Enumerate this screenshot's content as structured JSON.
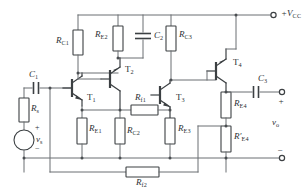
{
  "diagram": {
    "type": "circuit-schematic",
    "width": 304,
    "height": 195,
    "colors": {
      "background": "#ffffff",
      "wire": "#6b6f72",
      "component_outline": "#3c4043",
      "text": "#2b2f33"
    }
  },
  "supply": {
    "label_main": "+V",
    "label_sub": "CC"
  },
  "source": {
    "capacitor_label": "C",
    "capacitor_sub": "1",
    "resistor_label": "R",
    "resistor_sub": "s",
    "voltage_label": "v",
    "voltage_sub": "s",
    "plus": "+",
    "minus": "−"
  },
  "output": {
    "capacitor_label": "C",
    "capacitor_sub": "3",
    "voltage_label": "v",
    "voltage_sub": "o",
    "plus": "+",
    "minus": "−"
  },
  "transistors": [
    {
      "name": "T",
      "sub": "1",
      "x": 82,
      "y": 88,
      "type": "npn"
    },
    {
      "name": "T",
      "sub": "2",
      "x": 120,
      "y": 76,
      "type": "npn"
    },
    {
      "name": "T",
      "sub": "3",
      "x": 172,
      "y": 95,
      "type": "npn"
    },
    {
      "name": "T",
      "sub": "4",
      "x": 228,
      "y": 65,
      "type": "npn"
    }
  ],
  "resistors": [
    {
      "name": "R",
      "sub": "C1",
      "orientation": "vertical"
    },
    {
      "name": "R",
      "sub": "E2",
      "orientation": "vertical"
    },
    {
      "name": "R",
      "sub": "C3",
      "orientation": "vertical"
    },
    {
      "name": "R",
      "sub": "E1",
      "orientation": "vertical"
    },
    {
      "name": "R",
      "sub": "C2",
      "orientation": "vertical"
    },
    {
      "name": "R",
      "sub": "E3",
      "orientation": "vertical"
    },
    {
      "name": "R",
      "sub": "E4",
      "orientation": "vertical"
    },
    {
      "name": "R′",
      "sub": "E4",
      "orientation": "vertical"
    },
    {
      "name": "R",
      "sub": "f1",
      "orientation": "horizontal"
    },
    {
      "name": "R",
      "sub": "f2",
      "orientation": "horizontal"
    }
  ],
  "capacitors": [
    {
      "name": "C",
      "sub": "1",
      "orientation": "horizontal"
    },
    {
      "name": "C",
      "sub": "2",
      "orientation": "horizontal"
    },
    {
      "name": "C",
      "sub": "3",
      "orientation": "horizontal"
    }
  ],
  "labels": {
    "rc1": {
      "name": "R",
      "sub": "C1"
    },
    "re2": {
      "name": "R",
      "sub": "E2"
    },
    "c2": {
      "name": "C",
      "sub": "2"
    },
    "rc3": {
      "name": "R",
      "sub": "C3"
    },
    "t1": {
      "name": "T",
      "sub": "1"
    },
    "t2": {
      "name": "T",
      "sub": "2"
    },
    "t3": {
      "name": "T",
      "sub": "3"
    },
    "t4": {
      "name": "T",
      "sub": "4"
    },
    "c1": {
      "name": "C",
      "sub": "1"
    },
    "c3": {
      "name": "C",
      "sub": "3"
    },
    "rs": {
      "name": "R",
      "sub": "s"
    },
    "vs": {
      "name": "v",
      "sub": "s"
    },
    "vo": {
      "name": "v",
      "sub": "o"
    },
    "re1": {
      "name": "R",
      "sub": "E1"
    },
    "rc2": {
      "name": "R",
      "sub": "C2"
    },
    "re3": {
      "name": "R",
      "sub": "E3"
    },
    "re4": {
      "name": "R",
      "sub": "E4"
    },
    "re4p": {
      "name": "R′",
      "sub": "E4"
    },
    "rf1": {
      "name": "R",
      "sub": "f1"
    },
    "rf2": {
      "name": "R",
      "sub": "f2"
    },
    "vcc": {
      "name": "+V",
      "sub": "CC"
    }
  }
}
